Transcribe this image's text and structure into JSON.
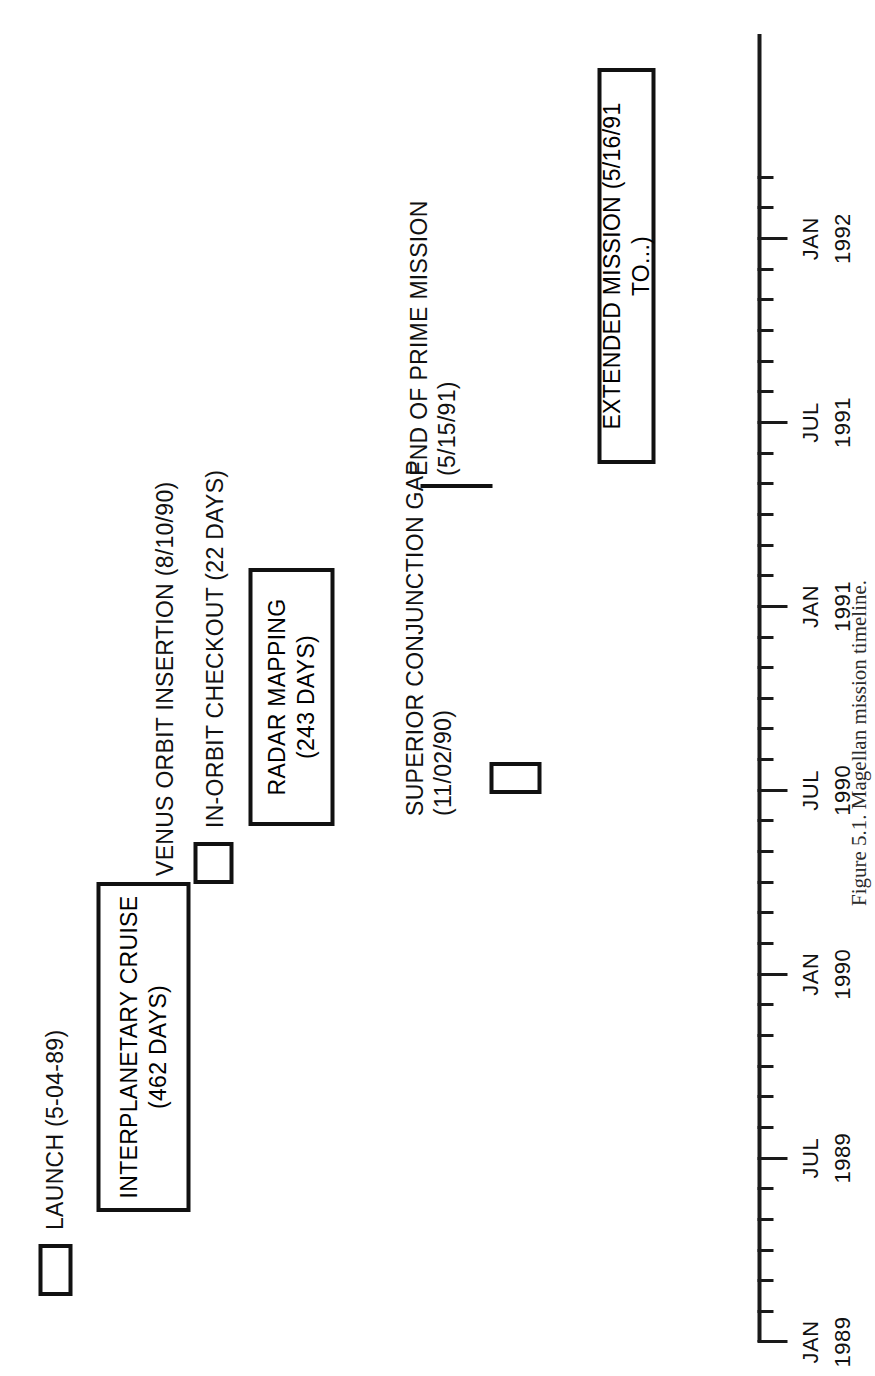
{
  "figure": {
    "caption": "Figure 5.1. Magellan mission timeline."
  },
  "axis": {
    "label_major": [
      {
        "month": "JAN",
        "year": "1989"
      },
      {
        "month": "JUL",
        "year": "1989"
      },
      {
        "month": "JAN",
        "year": "1990"
      },
      {
        "month": "JUL",
        "year": "1990"
      },
      {
        "month": "JAN",
        "year": "1991"
      },
      {
        "month": "JUL",
        "year": "1991"
      },
      {
        "month": "JAN",
        "year": "1992"
      }
    ],
    "start": "JAN 1989",
    "end": "1992",
    "minor_interval": "1 month",
    "major_interval": "6 months"
  },
  "events": [
    {
      "id": "launch",
      "label": "LAUNCH (5-04-89)",
      "date": "5-04-89",
      "kind": "box"
    },
    {
      "id": "interplanetary-cruise",
      "label_line1": "INTERPLANETARY CRUISE",
      "label_line2": "(462 DAYS)",
      "duration": "462 DAYS",
      "kind": "box"
    },
    {
      "id": "venus-orbit-insertion",
      "label": "VENUS ORBIT INSERTION (8/10/90)",
      "date": "8/10/90",
      "kind": "point"
    },
    {
      "id": "in-orbit-checkout",
      "label": "IN-ORBIT CHECKOUT (22 DAYS)",
      "duration": "22 DAYS",
      "kind": "box"
    },
    {
      "id": "radar-mapping",
      "label_line1": "RADAR MAPPING",
      "label_line2": "(243 DAYS)",
      "duration": "243 DAYS",
      "kind": "box"
    },
    {
      "id": "superior-conjunction-gap",
      "label_line1": "SUPERIOR CONJUNCTION GAP",
      "label_line2": "(11/02/90)",
      "date": "11/02/90",
      "kind": "box"
    },
    {
      "id": "end-of-prime-mission",
      "label_line1": "END OF PRIME MISSION",
      "label_line2": "(5/15/91)",
      "date": "5/15/91",
      "kind": "point"
    },
    {
      "id": "extended-mission",
      "label": "EXTENDED MISSION (5/16/91 TO...)",
      "date": "5/16/91 TO...",
      "kind": "box"
    }
  ],
  "chart_data": {
    "type": "timeline",
    "title": "Magellan mission timeline",
    "xlabel": "",
    "ylabel": "",
    "axis_start": "1989-01",
    "axis_end": "1992-02",
    "tick_unit": "month",
    "major_ticks": [
      "JAN 1989",
      "JUL 1989",
      "JAN 1990",
      "JUL 1990",
      "JAN 1991",
      "JUL 1991",
      "JAN 1992"
    ],
    "bars": [
      {
        "name": "LAUNCH",
        "start": "1989-05-04",
        "end": "1989-06-15",
        "note": "(5-04-89)"
      },
      {
        "name": "INTERPLANETARY CRUISE",
        "start": "1989-05-04",
        "end": "1990-08-10",
        "note": "(462 DAYS)"
      },
      {
        "name": "VENUS ORBIT INSERTION",
        "start": "1990-08-10",
        "end": "1990-08-10",
        "note": "(8/10/90)"
      },
      {
        "name": "IN-ORBIT CHECKOUT",
        "start": "1990-08-10",
        "end": "1990-09-01",
        "note": "(22 DAYS)"
      },
      {
        "name": "RADAR MAPPING",
        "start": "1990-09-15",
        "end": "1991-05-15",
        "note": "(243 DAYS)"
      },
      {
        "name": "SUPERIOR CONJUNCTION GAP",
        "start": "1990-11-02",
        "end": "1990-11-20",
        "note": "(11/02/90)"
      },
      {
        "name": "END OF PRIME MISSION",
        "start": "1991-05-15",
        "end": "1991-05-15",
        "note": "(5/15/91)"
      },
      {
        "name": "EXTENDED MISSION",
        "start": "1991-05-16",
        "end": "1992-02",
        "note": "(5/16/91 TO...)"
      }
    ]
  }
}
